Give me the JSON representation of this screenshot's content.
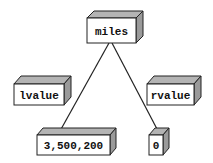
{
  "diagram": {
    "type": "tree",
    "colors": {
      "front": "#ffffff",
      "top": "#b4b4b4",
      "side": "#9a9a9a",
      "stroke": "#222222",
      "edge": "#222222"
    },
    "nodes": {
      "root": {
        "label": "miles"
      },
      "left_tag": {
        "label": "lvalue"
      },
      "right_tag": {
        "label": "rvalue"
      },
      "left_child": {
        "label": "3,500,200"
      },
      "right_child": {
        "label": "0"
      }
    },
    "edges": [
      {
        "from": "miles",
        "to": "3,500,200"
      },
      {
        "from": "miles",
        "to": "0"
      }
    ]
  }
}
